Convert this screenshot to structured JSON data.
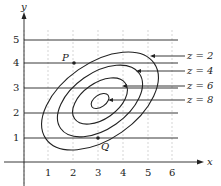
{
  "axes": {
    "x_label": "x",
    "y_label": "y",
    "x_ticks": [
      "1",
      "2",
      "3",
      "4",
      "5",
      "6"
    ],
    "y_ticks": [
      "1",
      "2",
      "3",
      "4",
      "5"
    ]
  },
  "points": {
    "P": {
      "label": "P",
      "x": 2,
      "y": 4
    },
    "Q": {
      "label": "Q",
      "x": 3,
      "y": 1
    }
  },
  "contours": [
    {
      "label": "z = 2",
      "value": 2
    },
    {
      "label": "z = 4",
      "value": 4
    },
    {
      "label": "z = 6",
      "value": 6
    },
    {
      "label": "z = 8",
      "value": 8
    }
  ],
  "horizontal_lines_y": [
    1,
    2,
    3,
    4,
    5
  ],
  "colors": {
    "line": "#222222",
    "grid": "#bbbbbb"
  }
}
